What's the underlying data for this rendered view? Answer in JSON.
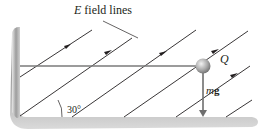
{
  "diagram": {
    "title_italic": "E",
    "title_rest": " field lines",
    "charge_label": "Q",
    "force_label_italic": "m",
    "force_label_vec": "g",
    "force_vector_arrow": "→",
    "angle_label": "30°",
    "field_line_angle_deg": 30,
    "colors": {
      "field_line": "#231f20",
      "string": "#7a7a7a",
      "ball": "#a8a8a8",
      "plate": "#b5b5b5"
    }
  }
}
